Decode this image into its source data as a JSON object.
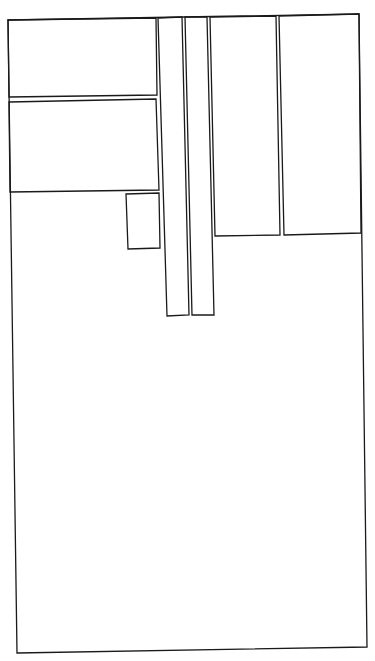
{
  "diagram": {
    "type": "rectangle-layout",
    "background": "#ffffff",
    "stroke_color": "#1a1a1a",
    "shapes": [
      {
        "id": "outer-frame",
        "points": "8,20 359,14 367,647 17,653"
      },
      {
        "id": "top-left-panel",
        "points": "8,20 156,18 157,95 9,97"
      },
      {
        "id": "middle-left-panel",
        "points": "9,102 156,99 159,190 10,192"
      },
      {
        "id": "small-box",
        "points": "126,194 159,193 160,248 128,249"
      },
      {
        "id": "vertical-strip-left",
        "points": "158,18 182,17 189,315 167,316"
      },
      {
        "id": "vertical-strip-right",
        "points": "185,17 207,17 214,315 192,315"
      },
      {
        "id": "top-right-panel-a",
        "points": "210,17 276,16 280,235 215,236"
      },
      {
        "id": "top-right-panel-b",
        "points": "279,16 359,14 361,233 284,235"
      }
    ]
  }
}
